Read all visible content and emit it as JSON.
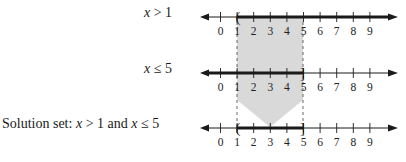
{
  "rows": [
    {
      "label_var": "x",
      "label_rest": " > 1",
      "y": 17,
      "thick_from": 1,
      "thick_to": "right",
      "endpoint": "(",
      "endpoint_at": 1
    },
    {
      "label_var": "x",
      "label_rest": " ≤ 5",
      "y": 73,
      "thick_from": "left",
      "thick_to": 5,
      "endpoint": "]",
      "endpoint_at": 5
    },
    {
      "label_prefix": "Solution set: ",
      "label_var": "x",
      "label_mid": " > 1 and ",
      "label_var2": "x",
      "label_rest": "  ≤ 5",
      "y": 128,
      "thick_from": 1,
      "thick_to": 5,
      "endpoint_left": "(",
      "endpoint_right": "]"
    }
  ],
  "tick_labels": [
    "0",
    "1",
    "2",
    "3",
    "4",
    "5",
    "6",
    "7",
    "8",
    "9"
  ],
  "colors": {
    "shade": "#d9d9d9",
    "line": "#1a1a1a"
  }
}
